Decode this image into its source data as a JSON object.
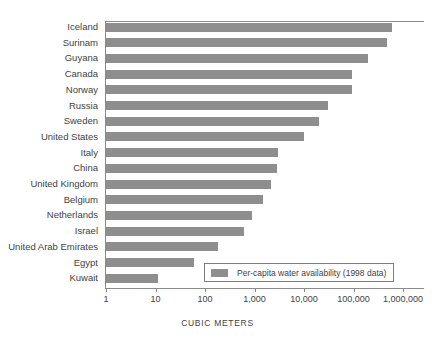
{
  "chart_data": {
    "type": "bar",
    "orientation": "horizontal",
    "title": "",
    "xlabel": "CUBIC METERS",
    "ylabel": "",
    "xscale": "log",
    "xlim": [
      1,
      1000000
    ],
    "grid": false,
    "legend_position": "inside-bottom-right",
    "bar_color": "#8e8e8e",
    "categories": [
      "Iceland",
      "Surinam",
      "Guyana",
      "Canada",
      "Norway",
      "Russia",
      "Sweden",
      "United States",
      "Italy",
      "China",
      "United Kingdom",
      "Belgium",
      "Netherlands",
      "Israel",
      "United Arab Emirates",
      "Egypt",
      "Kuwait"
    ],
    "values": [
      605000,
      470000,
      200000,
      92000,
      94000,
      31000,
      20000,
      10000,
      3000,
      2900,
      2200,
      1500,
      870,
      600,
      180,
      60,
      11
    ],
    "series": [
      {
        "name": "Per-capita water availability (1998 data)",
        "values": [
          605000,
          470000,
          200000,
          92000,
          94000,
          31000,
          20000,
          10000,
          3000,
          2900,
          2200,
          1500,
          870,
          600,
          180,
          60,
          11
        ]
      }
    ],
    "xticks": [
      1,
      10,
      100,
      1000,
      10000,
      100000,
      1000000
    ],
    "xticklabels": [
      "1",
      "10",
      "100",
      "1,000",
      "10,000",
      "100,000",
      "1,000,000"
    ]
  },
  "legend": {
    "label": "Per-capita water availability (1998 data)"
  },
  "axis": {
    "title": "CUBIC METERS"
  }
}
